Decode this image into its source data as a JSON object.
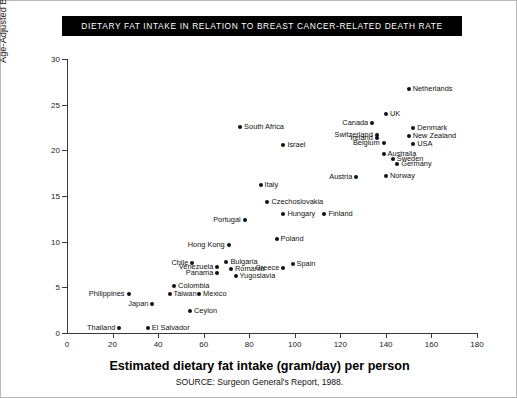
{
  "title": "DIETARY FAT INTAKE IN RELATION TO BREAST CANCER-RELATED DEATH RATE",
  "axis_title_x": "Estimated dietary fat intake (gram/day) per person",
  "axis_title_y": "Age-Adjusted Breast Cancer Death Rates per 100,000 Population",
  "source": "SOURCE: Surgeon General's Report, 1988.",
  "colors": {
    "title_background": "#000000",
    "title_text": "#ffffff",
    "point": "#111111",
    "axis": "#3a3a3a",
    "frame": "#b9b9b9"
  },
  "chart_data": {
    "type": "scatter",
    "title": "DIETARY FAT INTAKE IN RELATION TO BREAST CANCER-RELATED DEATH RATE",
    "xlabel": "Estimated dietary fat intake (gram/day) per person",
    "ylabel": "Age-Adjusted Breast Cancer Death Rates per 100,000 Population",
    "xlim": [
      0,
      180
    ],
    "ylim": [
      0,
      30
    ],
    "xticks": [
      0,
      20,
      40,
      60,
      80,
      100,
      120,
      140,
      160,
      180
    ],
    "yticks": [
      0,
      5,
      10,
      15,
      20,
      25,
      30
    ],
    "grid": false,
    "legend": false,
    "annotation": "SOURCE: Surgeon General's Report, 1988.",
    "points": [
      {
        "label": "Thailand",
        "x": 23,
        "y": 0.5,
        "side": "left"
      },
      {
        "label": "El Salvador",
        "x": 35.5,
        "y": 0.6,
        "side": "right"
      },
      {
        "label": "Philippines",
        "x": 27,
        "y": 4.3,
        "side": "left"
      },
      {
        "label": "Japan",
        "x": 37.5,
        "y": 3.2,
        "side": "left"
      },
      {
        "label": "Taiwan",
        "x": 45,
        "y": 4.3,
        "side": "right"
      },
      {
        "label": "Colombia",
        "x": 47,
        "y": 5.1,
        "side": "right"
      },
      {
        "label": "Mexico",
        "x": 58,
        "y": 4.3,
        "side": "right"
      },
      {
        "label": "Ceylon",
        "x": 54,
        "y": 2.4,
        "side": "right"
      },
      {
        "label": "Chile",
        "x": 55,
        "y": 7.7,
        "side": "left"
      },
      {
        "label": "Venezuela",
        "x": 66,
        "y": 7.2,
        "side": "left"
      },
      {
        "label": "Panama",
        "x": 66,
        "y": 6.6,
        "side": "left"
      },
      {
        "label": "Bulgaria",
        "x": 70,
        "y": 7.8,
        "side": "right"
      },
      {
        "label": "Romania",
        "x": 72,
        "y": 7.0,
        "side": "right"
      },
      {
        "label": "Yugoslavia",
        "x": 74,
        "y": 6.2,
        "side": "right"
      },
      {
        "label": "Hong Kong",
        "x": 71,
        "y": 9.6,
        "side": "left"
      },
      {
        "label": "Portugal",
        "x": 78,
        "y": 12.4,
        "side": "left"
      },
      {
        "label": "Poland",
        "x": 92,
        "y": 10.3,
        "side": "right"
      },
      {
        "label": "Spain",
        "x": 99,
        "y": 7.6,
        "side": "right"
      },
      {
        "label": "Greece",
        "x": 95,
        "y": 7.1,
        "side": "left"
      },
      {
        "label": "Hungary",
        "x": 95,
        "y": 13.0,
        "side": "right"
      },
      {
        "label": "Czechoslovakia",
        "x": 88,
        "y": 14.3,
        "side": "right"
      },
      {
        "label": "Finland",
        "x": 113,
        "y": 13.0,
        "side": "right"
      },
      {
        "label": "Italy",
        "x": 85,
        "y": 16.2,
        "side": "right"
      },
      {
        "label": "Israel",
        "x": 95,
        "y": 20.6,
        "side": "right"
      },
      {
        "label": "South Africa",
        "x": 76,
        "y": 22.6,
        "side": "right"
      },
      {
        "label": "Austria",
        "x": 127,
        "y": 17.1,
        "side": "left"
      },
      {
        "label": "Norway",
        "x": 140,
        "y": 17.2,
        "side": "right"
      },
      {
        "label": "Germany",
        "x": 145,
        "y": 18.5,
        "side": "right"
      },
      {
        "label": "Sweden",
        "x": 143,
        "y": 19.1,
        "side": "right"
      },
      {
        "label": "Australia",
        "x": 139,
        "y": 19.6,
        "side": "right"
      },
      {
        "label": "Belgium",
        "x": 139,
        "y": 20.8,
        "side": "left"
      },
      {
        "label": "USA",
        "x": 152,
        "y": 20.7,
        "side": "right"
      },
      {
        "label": "Ireland",
        "x": 136,
        "y": 21.4,
        "side": "left"
      },
      {
        "label": "Switzerland",
        "x": 136,
        "y": 21.7,
        "side": "left"
      },
      {
        "label": "New Zealand",
        "x": 150,
        "y": 21.6,
        "side": "right"
      },
      {
        "label": "Denmark",
        "x": 152,
        "y": 22.5,
        "side": "right"
      },
      {
        "label": "Canada",
        "x": 134,
        "y": 23.0,
        "side": "left"
      },
      {
        "label": "UK",
        "x": 140,
        "y": 24.0,
        "side": "right"
      },
      {
        "label": "Netherlands",
        "x": 150,
        "y": 26.7,
        "side": "right"
      }
    ]
  }
}
